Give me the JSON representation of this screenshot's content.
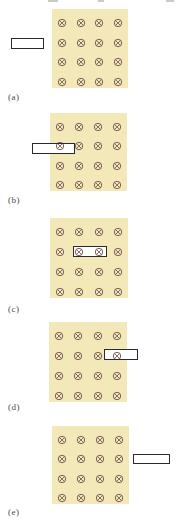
{
  "figure": {
    "type": "physics-diagram",
    "field_symbol": "b-into-page-circle-x",
    "grid": {
      "rows": 4,
      "cols": 4
    },
    "colors": {
      "page_bg": "#ffffff",
      "field_bg": "#f3e9b8",
      "symbol_stroke": "#7b5f58",
      "loop_border": "#2b2b2b",
      "loop_fill": "#ffffff",
      "label_text": "#4a4a4a",
      "fragment": "#c9c9c9"
    },
    "panels": [
      {
        "label": "(a)",
        "loop_position": "outside-left",
        "field": {
          "x": 52,
          "y": 9,
          "w": 76,
          "h": 79
        },
        "loop": {
          "x": 11,
          "y": 38,
          "w": 33,
          "h": 11
        },
        "label_pos": {
          "x": 8,
          "y": 92
        }
      },
      {
        "label": "(b)",
        "loop_position": "entering-left-edge",
        "field": {
          "x": 50,
          "y": 113,
          "w": 77,
          "h": 78
        },
        "loop": {
          "x": 32,
          "y": 143,
          "w": 43,
          "h": 11
        },
        "label_pos": {
          "x": 8,
          "y": 195
        }
      },
      {
        "label": "(c)",
        "loop_position": "fully-inside",
        "field": {
          "x": 50,
          "y": 218,
          "w": 78,
          "h": 80
        },
        "loop": {
          "x": 73,
          "y": 246,
          "w": 34,
          "h": 11
        },
        "label_pos": {
          "x": 8,
          "y": 304
        }
      },
      {
        "label": "(d)",
        "loop_position": "exiting-right-edge",
        "field": {
          "x": 49,
          "y": 322,
          "w": 78,
          "h": 80
        },
        "loop": {
          "x": 104,
          "y": 349,
          "w": 34,
          "h": 11
        },
        "label_pos": {
          "x": 8,
          "y": 402
        }
      },
      {
        "label": "(e)",
        "loop_position": "outside-right",
        "field": {
          "x": 52,
          "y": 426,
          "w": 77,
          "h": 78
        },
        "loop": {
          "x": 133,
          "y": 454,
          "w": 37,
          "h": 10
        },
        "label_pos": {
          "x": 8,
          "y": 507
        }
      }
    ],
    "top_fragments": [
      {
        "x": 48,
        "w": 10
      },
      {
        "x": 98,
        "w": 6
      },
      {
        "x": 166,
        "w": 8
      }
    ]
  }
}
